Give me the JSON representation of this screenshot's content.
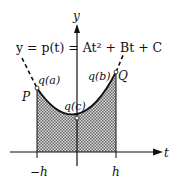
{
  "diagram": {
    "equation": "y = p(t) = At² + Bt + C",
    "axes": {
      "x_label": "t",
      "y_label": "y"
    },
    "points": {
      "P": "P",
      "Q": "Q",
      "qa": "q(a)",
      "qb": "q(b)",
      "qc": "q(c)"
    },
    "ticks": {
      "left": "−h",
      "right": "h"
    },
    "colors": {
      "ink": "#111111",
      "shade": "#9a9a9a"
    }
  }
}
